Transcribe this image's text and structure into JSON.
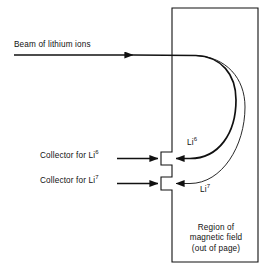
{
  "figure": {
    "background_color": "#ffffff",
    "stroke_color": "#111111"
  },
  "beam": {
    "label": "Beam of lithium ions",
    "arrow_label": "beam-arrow"
  },
  "collectors": [
    {
      "prefix": "Collector for Li",
      "isotope": "6",
      "name": "collector-li6"
    },
    {
      "prefix": "Collector for Li",
      "isotope": "7",
      "name": "collector-li7"
    }
  ],
  "trajectories": [
    {
      "prefix": "Li",
      "isotope": "6",
      "name": "trajectory-li6"
    },
    {
      "prefix": "Li",
      "isotope": "7",
      "name": "trajectory-li7"
    }
  ],
  "region": {
    "line1": "Region of",
    "line2": "magnetic field",
    "line3": "(out of page)"
  }
}
